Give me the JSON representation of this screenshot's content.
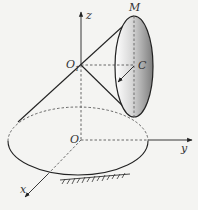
{
  "diagram": {
    "type": "3D mechanics figure: cone rolling on a plane with a disk",
    "labels": {
      "z_axis": "z",
      "y_axis": "y",
      "x_axis": "x",
      "apex": "O",
      "apex_sub": "1",
      "origin": "O",
      "disk_center": "C",
      "disk_top_point": "M"
    },
    "colors": {
      "line": "#222222",
      "dashed": "#444444",
      "disk_light": "#ffffff",
      "disk_dark": "#8a8a8a",
      "background": "#f4f4f2"
    }
  }
}
